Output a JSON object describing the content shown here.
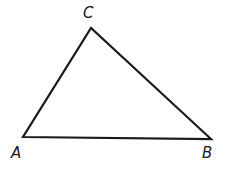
{
  "diagram": {
    "type": "triangle",
    "stroke_color": "#1a1a1a",
    "background": "#ffffff",
    "vertices": [
      {
        "name": "A",
        "x": 23,
        "y": 137
      },
      {
        "name": "B",
        "x": 211,
        "y": 139
      },
      {
        "name": "C",
        "x": 91,
        "y": 28
      }
    ],
    "labels": {
      "a": "A",
      "b": "B",
      "c": "C"
    }
  }
}
